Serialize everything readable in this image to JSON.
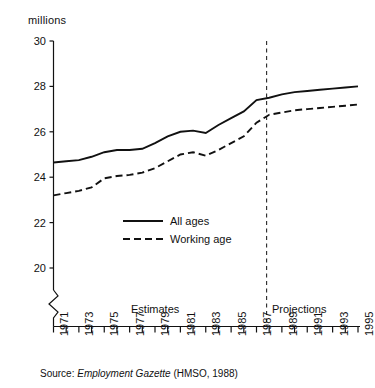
{
  "figure": {
    "y_axis_title": "millions",
    "source_prefix": "Source:",
    "source_italic": "Employment Gazette",
    "source_suffix": "(HMSO, 1988)",
    "estimates_label": "Estimates",
    "projections_label": "Projections",
    "legend": {
      "all_ages": "All ages",
      "working_age": "Working age"
    }
  },
  "chart_data": {
    "type": "line",
    "title": "",
    "subtitle": "",
    "xlabel": "",
    "ylabel": "millions",
    "ylim": [
      20,
      30
    ],
    "ytick_values": [
      20,
      22,
      24,
      26,
      28,
      30
    ],
    "ytick_labels": [
      "20",
      "22",
      "24",
      "26",
      "28",
      "30"
    ],
    "y_axis_break": true,
    "y_axis_break_note": "zigzag break below 20",
    "xlim": [
      1971,
      1995
    ],
    "x": [
      1971,
      1972,
      1973,
      1974,
      1975,
      1976,
      1977,
      1978,
      1979,
      1980,
      1981,
      1982,
      1983,
      1984,
      1985,
      1986,
      1987,
      1988,
      1989,
      1990,
      1991,
      1992,
      1993,
      1994,
      1995
    ],
    "xtick_values": [
      1971,
      1972,
      1973,
      1974,
      1975,
      1976,
      1977,
      1978,
      1979,
      1980,
      1981,
      1982,
      1983,
      1984,
      1985,
      1986,
      1987,
      1988,
      1989,
      1990,
      1991,
      1992,
      1993,
      1994,
      1995
    ],
    "xtick_labels": [
      "1971",
      "",
      "1973",
      "",
      "1975",
      "",
      "1977",
      "",
      "1979",
      "",
      "1981",
      "",
      "1983",
      "",
      "1985",
      "",
      "1987",
      "",
      "1989",
      "",
      "1991",
      "",
      "1993",
      "",
      "1995"
    ],
    "grid": false,
    "legend_position": "center-left-inside",
    "series": [
      {
        "name": "All ages",
        "style": "solid",
        "color": "#111111",
        "values": [
          24.65,
          24.7,
          24.75,
          24.9,
          25.1,
          25.2,
          25.2,
          25.25,
          25.5,
          25.8,
          26.0,
          26.05,
          25.95,
          26.3,
          26.6,
          26.9,
          27.4,
          27.5,
          27.65,
          27.75,
          27.8,
          27.85,
          27.9,
          27.95,
          28.0
        ]
      },
      {
        "name": "Working age",
        "style": "dashed",
        "color": "#111111",
        "values": [
          23.2,
          23.3,
          23.4,
          23.55,
          23.95,
          24.05,
          24.1,
          24.2,
          24.4,
          24.7,
          25.0,
          25.1,
          24.95,
          25.2,
          25.5,
          25.8,
          26.4,
          26.75,
          26.85,
          26.95,
          27.0,
          27.05,
          27.1,
          27.15,
          27.2
        ]
      }
    ],
    "annotations": [
      {
        "name": "projection-divider",
        "type": "vline",
        "x": 1987.8,
        "style": "dashed"
      },
      {
        "name": "estimates-region",
        "type": "text",
        "text": "Estimates"
      },
      {
        "name": "projections-region",
        "type": "text",
        "text": "Projections"
      }
    ]
  }
}
